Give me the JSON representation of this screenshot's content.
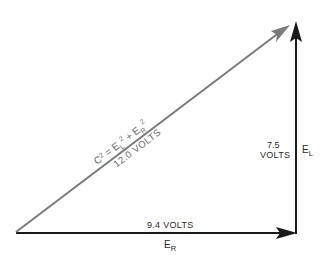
{
  "diagram": {
    "type": "vector-triangle",
    "colors": {
      "background": "#ffffff",
      "sides": "#1a1a1a",
      "hypotenuse": "#7a7a7a",
      "hypotenuse_text": "#6a6a6a",
      "side_text": "#2a2a2a"
    },
    "hypotenuse": {
      "formula_c": "C2 = E",
      "formula_parts": {
        "c": "C",
        "c_exp": "2",
        "eq": " = ",
        "el": "E",
        "el_sub": "L",
        "el_exp": "2",
        "plus": " + ",
        "er": "E",
        "er_sub": "R",
        "er_exp": "2"
      },
      "value": "12.0 VOLTS"
    },
    "horizontal": {
      "value": "9.4 VOLTS",
      "label": "E",
      "label_sub": "R"
    },
    "vertical": {
      "value_line1": "7.5",
      "value_line2": "VOLTS",
      "label": "E",
      "label_sub": "L"
    }
  }
}
